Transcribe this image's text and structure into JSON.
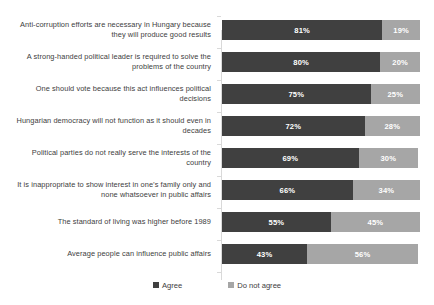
{
  "chart_data": {
    "type": "bar",
    "subtype": "horizontal-stacked-100",
    "title": "",
    "xlabel": "",
    "ylabel": "",
    "xlim": [
      0,
      100
    ],
    "grid": false,
    "legend_position": "bottom-center",
    "categories": [
      "Anti-corruption efforts are necessary in Hungary because they will produce good results",
      "A strong-handed political leader is required to solve the problems of the country",
      "One should vote because this act influences political decisions",
      "Hungarian democracy will not function as it should even in decades",
      "Political parties do not really serve the interests of the country",
      "It is inappropriate to show interest in one’s family only and none whatsoever in public affairs",
      "The standard of living was higher before 1989",
      "Average people can influence public affairs"
    ],
    "series": [
      {
        "name": "Agree",
        "color": "#404040",
        "values": [
          81,
          80,
          75,
          72,
          69,
          66,
          55,
          43
        ]
      },
      {
        "name": "Do not agree",
        "color": "#a6a6a6",
        "values": [
          19,
          20,
          25,
          28,
          30,
          34,
          45,
          56
        ]
      }
    ],
    "value_labels": [
      {
        "agree": "81%",
        "disagree": "19%"
      },
      {
        "agree": "80%",
        "disagree": "20%"
      },
      {
        "agree": "75%",
        "disagree": "25%"
      },
      {
        "agree": "72%",
        "disagree": "28%"
      },
      {
        "agree": "69%",
        "disagree": "30%"
      },
      {
        "agree": "66%",
        "disagree": "34%"
      },
      {
        "agree": "55%",
        "disagree": "45%"
      },
      {
        "agree": "43%",
        "disagree": "56%"
      }
    ]
  },
  "legend": {
    "items": [
      {
        "label": "Agree",
        "color": "#404040"
      },
      {
        "label": "Do not agree",
        "color": "#a6a6a6"
      }
    ]
  },
  "colors": {
    "agree": "#404040",
    "disagree": "#a6a6a6",
    "axis": "#d9d9d9",
    "text": "#3d3d3d",
    "background": "#ffffff"
  }
}
